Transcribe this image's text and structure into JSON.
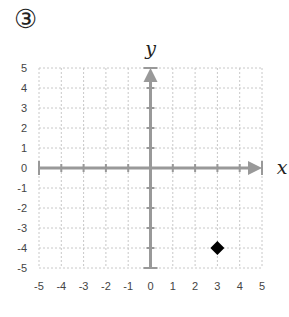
{
  "problem_label": "③",
  "chart_data": {
    "type": "scatter",
    "title": "",
    "xlabel": "x",
    "ylabel": "y",
    "xlim": [
      -5,
      5
    ],
    "ylim": [
      -5,
      5
    ],
    "x_ticks": [
      "-5",
      "-4",
      "-3",
      "-2",
      "-1",
      "0",
      "1",
      "2",
      "3",
      "4",
      "5"
    ],
    "y_ticks": [
      "5",
      "4",
      "3",
      "2",
      "1",
      "0",
      "-1",
      "-2",
      "-3",
      "-4",
      "-5"
    ],
    "grid": true,
    "grid_style": "dashed",
    "series": [
      {
        "name": "point",
        "marker": "diamond",
        "color": "#000000",
        "points": [
          {
            "x": 3,
            "y": -4
          }
        ]
      }
    ],
    "axis_color": "#999999",
    "grid_color": "#c8c8c8"
  }
}
